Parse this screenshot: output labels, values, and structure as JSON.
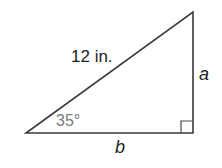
{
  "diagram": {
    "type": "right-triangle",
    "vertices": {
      "left": [
        26,
        133
      ],
      "right_angle": [
        193,
        133
      ],
      "top": [
        193,
        12
      ]
    },
    "hypotenuse": {
      "label": "12 in."
    },
    "vertical_leg": {
      "label": "a"
    },
    "horizontal_leg": {
      "label": "b"
    },
    "angle": {
      "label": "35°",
      "vertex": "left"
    },
    "right_angle_marker": true,
    "colors": {
      "stroke": "#3a3a3a",
      "text": "#1e1e1e",
      "angle_text": "#7a7a7a"
    }
  }
}
